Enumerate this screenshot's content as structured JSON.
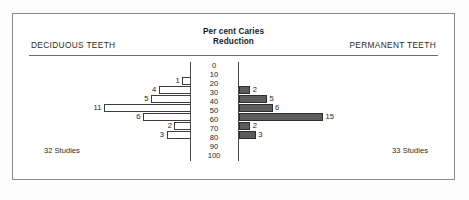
{
  "header": {
    "left_label": "DECIDUOUS TEETH",
    "right_label": "PERMANENT TEETH",
    "title_line1": "Per cent Caries",
    "title_line2": "Reduction"
  },
  "footer": {
    "left_label": "32 Studies",
    "right_label": "33 Studies"
  },
  "colors": {
    "frame": "#8a8a8a",
    "rule": "#6d6d6d",
    "axis": "#4a4a4a",
    "left_bar_fill": "#ffffff",
    "left_bar_stroke": "#3d3d3d",
    "right_bar_fill": "#5c5c5c",
    "right_bar_stroke": "#2e2e2e",
    "text": "#1d1d1d"
  },
  "chart_data": {
    "type": "bar",
    "orientation": "horizontal",
    "layout": "back-to-back population pyramid",
    "title": "Per cent Caries Reduction",
    "subtitle": "",
    "xlabel": "Number of studies",
    "ylabel": "Per cent Caries Reduction",
    "grid": false,
    "legend_position": "none",
    "tick_labels": [
      "0",
      "10",
      "20",
      "30",
      "40",
      "50",
      "60",
      "70",
      "80",
      "90",
      "100"
    ],
    "tick_values": [
      0,
      10,
      20,
      30,
      40,
      50,
      60,
      70,
      80,
      90,
      100
    ],
    "bands": [
      "0-10",
      "10-20",
      "20-30",
      "30-40",
      "40-50",
      "50-60",
      "60-70",
      "70-80",
      "80-90",
      "90-100"
    ],
    "xlim": [
      0,
      15
    ],
    "series": [
      {
        "name": "DECIDUOUS TEETH",
        "side": "left",
        "total_studies": 32,
        "total_label": "32 Studies",
        "style": "hollow",
        "bars": [
          {
            "band": "0-10",
            "value": 0,
            "label": ""
          },
          {
            "band": "10-20",
            "value": 1,
            "label": "1"
          },
          {
            "band": "20-30",
            "value": 4,
            "label": "4"
          },
          {
            "band": "30-40",
            "value": 5,
            "label": "5"
          },
          {
            "band": "40-50",
            "value": 11,
            "label": "11"
          },
          {
            "band": "50-60",
            "value": 6,
            "label": "6"
          },
          {
            "band": "60-70",
            "value": 2,
            "label": "2"
          },
          {
            "band": "70-80",
            "value": 3,
            "label": "3"
          },
          {
            "band": "80-90",
            "value": 0,
            "label": ""
          },
          {
            "band": "90-100",
            "value": 0,
            "label": ""
          }
        ]
      },
      {
        "name": "PERMANENT TEETH",
        "side": "right",
        "total_studies": 33,
        "total_label": "33 Studies",
        "style": "filled",
        "bars": [
          {
            "band": "0-10",
            "value": 0,
            "label": ""
          },
          {
            "band": "10-20",
            "value": 0,
            "label": ""
          },
          {
            "band": "20-30",
            "value": 2,
            "label": "2"
          },
          {
            "band": "30-40",
            "value": 5,
            "label": "5"
          },
          {
            "band": "40-50",
            "value": 6,
            "label": "6"
          },
          {
            "band": "50-60",
            "value": 15,
            "label": "15"
          },
          {
            "band": "60-70",
            "value": 2,
            "label": "2"
          },
          {
            "band": "70-80",
            "value": 3,
            "label": "3"
          },
          {
            "band": "80-90",
            "value": 0,
            "label": ""
          },
          {
            "band": "90-100",
            "value": 0,
            "label": ""
          }
        ]
      }
    ]
  }
}
